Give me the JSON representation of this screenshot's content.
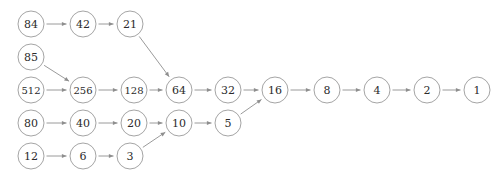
{
  "figure": {
    "background_color": "#ffffff",
    "node_stroke_color": "#9a9a9a",
    "node_fill_color": "#ffffff",
    "label_color": "#2b2b2b",
    "edge_color": "#8e8e8e",
    "node_radius": 13,
    "width": 503,
    "height": 177
  },
  "nodes": [
    {
      "id": "n84",
      "label": "84",
      "x": 31,
      "y": 24,
      "row": 1,
      "font_size": 11
    },
    {
      "id": "n42",
      "label": "42",
      "x": 83,
      "y": 24,
      "row": 1,
      "font_size": 11
    },
    {
      "id": "n21",
      "label": "21",
      "x": 130,
      "y": 24,
      "row": 1,
      "font_size": 11
    },
    {
      "id": "n85",
      "label": "85",
      "x": 31,
      "y": 57,
      "row": 2,
      "font_size": 11
    },
    {
      "id": "n512",
      "label": "512",
      "x": 31,
      "y": 90,
      "row": 3,
      "font_size": 10
    },
    {
      "id": "n256",
      "label": "256",
      "x": 83,
      "y": 90,
      "row": 3,
      "font_size": 10
    },
    {
      "id": "n128",
      "label": "128",
      "x": 134,
      "y": 90,
      "row": 3,
      "font_size": 10
    },
    {
      "id": "n64",
      "label": "64",
      "x": 179,
      "y": 90,
      "row": 3,
      "font_size": 11
    },
    {
      "id": "n32",
      "label": "32",
      "x": 228,
      "y": 90,
      "row": 3,
      "font_size": 11
    },
    {
      "id": "n16",
      "label": "16",
      "x": 275,
      "y": 90,
      "row": 3,
      "font_size": 11
    },
    {
      "id": "n8",
      "label": "8",
      "x": 327,
      "y": 90,
      "row": 3,
      "font_size": 11
    },
    {
      "id": "n4",
      "label": "4",
      "x": 377,
      "y": 90,
      "row": 3,
      "font_size": 11
    },
    {
      "id": "n2",
      "label": "2",
      "x": 427,
      "y": 90,
      "row": 3,
      "font_size": 11
    },
    {
      "id": "n1",
      "label": "1",
      "x": 477,
      "y": 90,
      "row": 3,
      "font_size": 11
    },
    {
      "id": "n80",
      "label": "80",
      "x": 31,
      "y": 123,
      "row": 4,
      "font_size": 11
    },
    {
      "id": "n40",
      "label": "40",
      "x": 83,
      "y": 123,
      "row": 4,
      "font_size": 11
    },
    {
      "id": "n20",
      "label": "20",
      "x": 134,
      "y": 123,
      "row": 4,
      "font_size": 11
    },
    {
      "id": "n10",
      "label": "10",
      "x": 179,
      "y": 123,
      "row": 4,
      "font_size": 11
    },
    {
      "id": "n5",
      "label": "5",
      "x": 228,
      "y": 123,
      "row": 4,
      "font_size": 11
    },
    {
      "id": "n12",
      "label": "12",
      "x": 31,
      "y": 156,
      "row": 5,
      "font_size": 11
    },
    {
      "id": "n6",
      "label": "6",
      "x": 83,
      "y": 156,
      "row": 5,
      "font_size": 11
    },
    {
      "id": "n3",
      "label": "3",
      "x": 130,
      "y": 156,
      "row": 5,
      "font_size": 11
    }
  ],
  "edges": [
    {
      "from": "n84",
      "to": "n42",
      "kind": "horizontal"
    },
    {
      "from": "n42",
      "to": "n21",
      "kind": "horizontal"
    },
    {
      "from": "n21",
      "to": "n64",
      "kind": "diagonal"
    },
    {
      "from": "n85",
      "to": "n256",
      "kind": "diagonal"
    },
    {
      "from": "n512",
      "to": "n256",
      "kind": "horizontal"
    },
    {
      "from": "n256",
      "to": "n128",
      "kind": "horizontal"
    },
    {
      "from": "n128",
      "to": "n64",
      "kind": "horizontal"
    },
    {
      "from": "n64",
      "to": "n32",
      "kind": "horizontal"
    },
    {
      "from": "n32",
      "to": "n16",
      "kind": "horizontal"
    },
    {
      "from": "n16",
      "to": "n8",
      "kind": "horizontal"
    },
    {
      "from": "n8",
      "to": "n4",
      "kind": "horizontal"
    },
    {
      "from": "n4",
      "to": "n2",
      "kind": "horizontal"
    },
    {
      "from": "n2",
      "to": "n1",
      "kind": "horizontal"
    },
    {
      "from": "n80",
      "to": "n40",
      "kind": "horizontal"
    },
    {
      "from": "n40",
      "to": "n20",
      "kind": "horizontal"
    },
    {
      "from": "n20",
      "to": "n10",
      "kind": "horizontal"
    },
    {
      "from": "n10",
      "to": "n5",
      "kind": "horizontal"
    },
    {
      "from": "n5",
      "to": "n16",
      "kind": "diagonal"
    },
    {
      "from": "n12",
      "to": "n6",
      "kind": "horizontal"
    },
    {
      "from": "n6",
      "to": "n3",
      "kind": "horizontal"
    },
    {
      "from": "n3",
      "to": "n10",
      "kind": "diagonal"
    }
  ],
  "chart_data": {
    "type": "diagram",
    "categories": [
      "84",
      "42",
      "21",
      "85",
      "512",
      "256",
      "128",
      "64",
      "32",
      "16",
      "8",
      "4",
      "2",
      "1",
      "80",
      "40",
      "20",
      "10",
      "5",
      "12",
      "6",
      "3"
    ],
    "values": [
      84,
      42,
      21,
      85,
      512,
      256,
      128,
      64,
      32,
      16,
      8,
      4,
      2,
      1,
      80,
      40,
      20,
      10,
      5,
      12,
      6,
      3
    ],
    "rows": [
      {
        "row": 1,
        "sequence": [
          "84",
          "42",
          "21"
        ]
      },
      {
        "row": 2,
        "sequence": [
          "85"
        ]
      },
      {
        "row": 3,
        "sequence": [
          "512",
          "256",
          "128",
          "64",
          "32",
          "16",
          "8",
          "4",
          "2",
          "1"
        ]
      },
      {
        "row": 4,
        "sequence": [
          "80",
          "40",
          "20",
          "10",
          "5"
        ]
      },
      {
        "row": 5,
        "sequence": [
          "12",
          "6",
          "3"
        ]
      }
    ],
    "cross_row_links": [
      {
        "from": "21",
        "to": "64"
      },
      {
        "from": "85",
        "to": "256"
      },
      {
        "from": "5",
        "to": "16"
      },
      {
        "from": "3",
        "to": "10"
      }
    ],
    "xlabel": "",
    "ylabel": "",
    "grid": false,
    "legend": "none"
  }
}
